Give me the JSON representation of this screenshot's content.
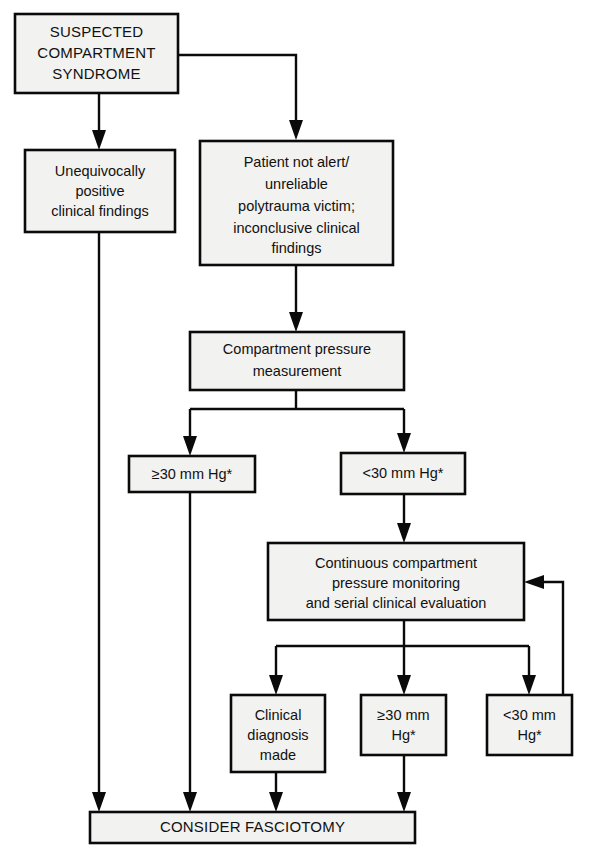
{
  "diagram": {
    "type": "flowchart",
    "colors": {
      "box_fill": "#f2f2f0",
      "line": "#0a0a0a",
      "text": "#111111",
      "background": "#ffffff"
    },
    "nodes": [
      {
        "id": "suspected",
        "lines": [
          "SUSPECTED",
          "COMPARTMENT",
          "SYNDROME"
        ],
        "style": "caps"
      },
      {
        "id": "unequivocal",
        "lines": [
          "Unequivocally",
          "positive",
          "clinical findings"
        ],
        "style": "normal"
      },
      {
        "id": "not-alert",
        "lines": [
          "Patient not alert/",
          "unreliable",
          "polytrauma victim;",
          "inconclusive clinical",
          "findings"
        ],
        "style": "normal"
      },
      {
        "id": "measurement",
        "lines": [
          "Compartment pressure",
          "measurement"
        ],
        "style": "normal"
      },
      {
        "id": "ge30-upper",
        "lines": [
          "≥30 mm Hg*"
        ],
        "style": "normal"
      },
      {
        "id": "lt30-upper",
        "lines": [
          "<30 mm Hg*"
        ],
        "style": "normal"
      },
      {
        "id": "continuous",
        "lines": [
          "Continuous compartment",
          "pressure monitoring",
          "and serial clinical evaluation"
        ],
        "style": "normal"
      },
      {
        "id": "clinical-dx",
        "lines": [
          "Clinical",
          "diagnosis",
          "made"
        ],
        "style": "normal"
      },
      {
        "id": "ge30-lower",
        "lines": [
          "≥30 mm",
          "Hg*"
        ],
        "style": "normal"
      },
      {
        "id": "lt30-lower",
        "lines": [
          "<30 mm",
          "Hg*"
        ],
        "style": "normal"
      },
      {
        "id": "fasciotomy",
        "lines": [
          "CONSIDER FASCIOTOMY"
        ],
        "style": "caps"
      }
    ],
    "edges": [
      {
        "from": "suspected",
        "to": "unequivocal"
      },
      {
        "from": "suspected",
        "to": "not-alert"
      },
      {
        "from": "not-alert",
        "to": "measurement"
      },
      {
        "from": "measurement",
        "to": "ge30-upper"
      },
      {
        "from": "measurement",
        "to": "lt30-upper"
      },
      {
        "from": "lt30-upper",
        "to": "continuous"
      },
      {
        "from": "continuous",
        "to": "clinical-dx"
      },
      {
        "from": "continuous",
        "to": "ge30-lower"
      },
      {
        "from": "continuous",
        "to": "lt30-lower"
      },
      {
        "from": "lt30-lower",
        "to": "continuous",
        "kind": "feedback"
      },
      {
        "from": "unequivocal",
        "to": "fasciotomy"
      },
      {
        "from": "ge30-upper",
        "to": "fasciotomy"
      },
      {
        "from": "clinical-dx",
        "to": "fasciotomy"
      },
      {
        "from": "ge30-lower",
        "to": "fasciotomy"
      }
    ]
  }
}
